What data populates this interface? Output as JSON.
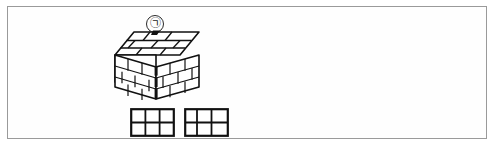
{
  "figure": {
    "frame": {
      "border_color": "#9a9a9a",
      "background": "#ffffff"
    },
    "ink_color": "#111111",
    "fill_black": "#000000",
    "fill_white": "#ffffff"
  },
  "panels": [
    {
      "id": "a",
      "label": "㉠",
      "label_name": "circled-giyeok",
      "solid": {
        "name": "brick-cuboid-solid",
        "description": "Isometric cuboid built of bricks, full solid block",
        "rows": 3,
        "bricks_per_row_front": 4,
        "bricks_per_row_side": 3,
        "top_layer_bricks": 6,
        "has_hole": false
      },
      "plans": [
        {
          "name": "layer-plan-odd",
          "cols": 3,
          "rows": 2,
          "cells": [
            {
              "x": 0,
              "y": 0,
              "w": 1,
              "h": 1,
              "fill": "white"
            },
            {
              "x": 1,
              "y": 0,
              "w": 1,
              "h": 1,
              "fill": "white"
            },
            {
              "x": 2,
              "y": 0,
              "w": 1,
              "h": 1,
              "fill": "white"
            },
            {
              "x": 0,
              "y": 1,
              "w": 1,
              "h": 1,
              "fill": "white"
            },
            {
              "x": 1,
              "y": 1,
              "w": 1,
              "h": 1,
              "fill": "white"
            },
            {
              "x": 2,
              "y": 1,
              "w": 1,
              "h": 1,
              "fill": "white"
            }
          ],
          "split_col": 2
        },
        {
          "name": "layer-plan-even",
          "cols": 3,
          "rows": 2,
          "cells": [
            {
              "x": 0,
              "y": 0,
              "w": 1,
              "h": 1,
              "fill": "white"
            },
            {
              "x": 1,
              "y": 0,
              "w": 1,
              "h": 1,
              "fill": "white"
            },
            {
              "x": 2,
              "y": 0,
              "w": 1,
              "h": 1,
              "fill": "white"
            },
            {
              "x": 0,
              "y": 1,
              "w": 1,
              "h": 1,
              "fill": "white"
            },
            {
              "x": 1,
              "y": 1,
              "w": 1,
              "h": 1,
              "fill": "white"
            },
            {
              "x": 2,
              "y": 1,
              "w": 1,
              "h": 1,
              "fill": "white"
            }
          ],
          "split_col": 1
        }
      ]
    },
    {
      "id": "b",
      "label": "㉡",
      "label_name": "circled-nieun",
      "solid": {
        "name": "brick-cuboid-solid-with-hole",
        "description": "Isometric cuboid built of bricks with a square hole on the top face",
        "rows": 3,
        "bricks_per_row_front": 4,
        "bricks_per_row_side": 3,
        "top_layer_bricks": 5,
        "has_hole": true
      },
      "plans": [
        {
          "name": "layer-plan-pinwheel-1",
          "cols": 3,
          "rows": 3,
          "black_cell": {
            "x": 1,
            "y": 1
          },
          "pieces": [
            {
              "x": 0,
              "y": 0,
              "w": 1,
              "h": 1,
              "fill": "white"
            },
            {
              "x": 1,
              "y": 0,
              "w": 2,
              "h": 1,
              "fill": "white"
            },
            {
              "x": 0,
              "y": 1,
              "w": 1,
              "h": 2,
              "fill": "white"
            },
            {
              "x": 2,
              "y": 1,
              "w": 1,
              "h": 1,
              "fill": "white"
            },
            {
              "x": 1,
              "y": 2,
              "w": 2,
              "h": 1,
              "fill": "white"
            },
            {
              "x": 1,
              "y": 1,
              "w": 1,
              "h": 1,
              "fill": "black"
            }
          ]
        },
        {
          "name": "layer-plan-pinwheel-2",
          "cols": 3,
          "rows": 3,
          "black_cell": {
            "x": 1,
            "y": 1
          },
          "pieces": [
            {
              "x": 0,
              "y": 0,
              "w": 2,
              "h": 1,
              "fill": "white"
            },
            {
              "x": 2,
              "y": 0,
              "w": 1,
              "h": 2,
              "fill": "white"
            },
            {
              "x": 0,
              "y": 1,
              "w": 1,
              "h": 1,
              "fill": "white"
            },
            {
              "x": 0,
              "y": 2,
              "w": 1,
              "h": 1,
              "fill": "white"
            },
            {
              "x": 1,
              "y": 2,
              "w": 2,
              "h": 1,
              "fill": "white"
            },
            {
              "x": 1,
              "y": 1,
              "w": 1,
              "h": 1,
              "fill": "black"
            }
          ]
        }
      ]
    }
  ]
}
